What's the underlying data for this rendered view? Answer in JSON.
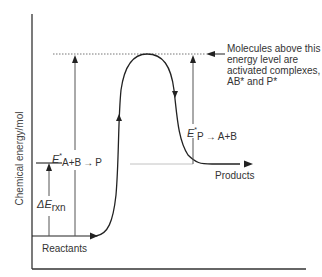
{
  "diagram": {
    "type": "reaction-energy-profile",
    "axis": {
      "y_label": "Chemical energy/mol"
    },
    "levels": {
      "reactants_label": "Reactants",
      "products_label": "Products"
    },
    "forward_activation": {
      "symbol": "E",
      "superscript": "*",
      "subscript": "A+B → P"
    },
    "reverse_activation": {
      "symbol": "E",
      "superscript": "*",
      "subscript": "P → A+B"
    },
    "delta_e": {
      "symbol": "ΔE",
      "subscript": "rxn"
    },
    "annotation": {
      "lines": [
        "Molecules above this",
        "energy level are",
        "activated complexes,",
        "AB* and P*"
      ]
    },
    "colors": {
      "curve": "#222222",
      "axis": "#333333",
      "arrows": "#555555",
      "dashed": "#666666",
      "guide": "#bbbbbb"
    }
  }
}
